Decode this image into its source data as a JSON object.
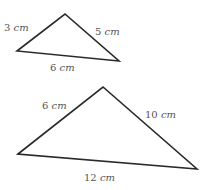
{
  "diagram": {
    "stroke_color": "#2a2a2a",
    "label_color": "#555555",
    "triangles": [
      {
        "name": "small-triangle",
        "vertices": [
          [
            17,
            51
          ],
          [
            65,
            14
          ],
          [
            119,
            61
          ]
        ],
        "sides": [
          {
            "label": "3 cm",
            "x": 4,
            "y": 31
          },
          {
            "label": "5 cm",
            "x": 95,
            "y": 35
          },
          {
            "label": "6 cm",
            "x": 50,
            "y": 71
          }
        ]
      },
      {
        "name": "large-triangle",
        "vertices": [
          [
            18,
            154
          ],
          [
            103,
            87
          ],
          [
            197,
            169
          ]
        ],
        "sides": [
          {
            "label": "6 cm",
            "x": 42,
            "y": 109
          },
          {
            "label": "10 cm",
            "x": 145,
            "y": 118
          },
          {
            "label": "12 cm",
            "x": 84,
            "y": 181
          }
        ]
      }
    ]
  }
}
